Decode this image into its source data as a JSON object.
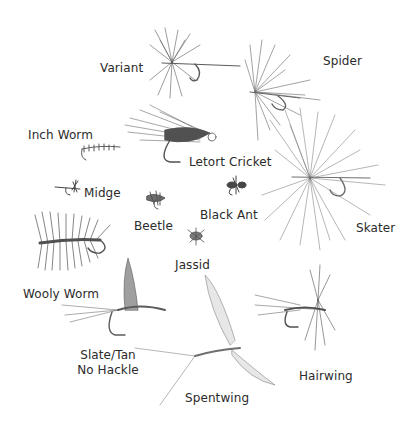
{
  "flies": [
    {
      "id": "variant",
      "label": "Variant",
      "x": 100,
      "y": 60
    },
    {
      "id": "spider",
      "label": "Spider",
      "x": 323,
      "y": 53
    },
    {
      "id": "inch-worm",
      "label": "Inch Worm",
      "x": 28,
      "y": 128
    },
    {
      "id": "letort-cricket",
      "label": "Letort Cricket",
      "x": 189,
      "y": 154
    },
    {
      "id": "midge",
      "label": "Midge",
      "x": 84,
      "y": 186
    },
    {
      "id": "beetle",
      "label": "Beetle",
      "x": 134,
      "y": 219
    },
    {
      "id": "black-ant",
      "label": "Black Ant",
      "x": 200,
      "y": 208
    },
    {
      "id": "skater",
      "label": "Skater",
      "x": 355,
      "y": 220
    },
    {
      "id": "jassid",
      "label": "Jassid",
      "x": 175,
      "y": 258
    },
    {
      "id": "wooly-worm",
      "label": "Wooly Worm",
      "x": 23,
      "y": 287
    },
    {
      "id": "slate-tan",
      "label": "Slate/Tan",
      "label2": "No Hackle",
      "x": 80,
      "y": 348
    },
    {
      "id": "hairwing",
      "label": "Hairwing",
      "x": 299,
      "y": 369
    },
    {
      "id": "spentwing",
      "label": "Spentwing",
      "x": 185,
      "y": 391
    }
  ]
}
